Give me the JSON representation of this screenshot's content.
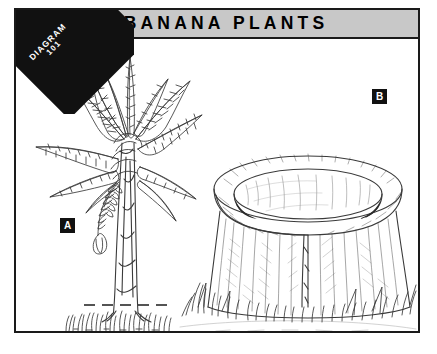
{
  "plate": {
    "title": "BANANA PLANTS",
    "ribbon": {
      "line1": "DIAGRAM",
      "line2": "101"
    },
    "frame_color": "#1a1a1a",
    "titlebar_color": "#c8c8c8",
    "ribbon_color": "#111111",
    "background_color": "#ffffff",
    "ink_color": "#333333"
  },
  "callouts": [
    {
      "id": "a",
      "label": "A",
      "subject": "banana-plant"
    },
    {
      "id": "b",
      "label": "B",
      "subject": "cut-stump"
    }
  ],
  "illustration": {
    "style": "pen-and-ink line drawing",
    "figures": [
      {
        "name": "banana-plant",
        "label": "A",
        "parts": [
          "leaves",
          "pseudostem",
          "flower-bract",
          "roots",
          "ground-grass",
          "cut-line"
        ]
      },
      {
        "name": "cut-stump",
        "label": "B",
        "parts": [
          "hollow-rim",
          "cut-surface",
          "bark-sides",
          "ground-grass"
        ]
      }
    ]
  }
}
